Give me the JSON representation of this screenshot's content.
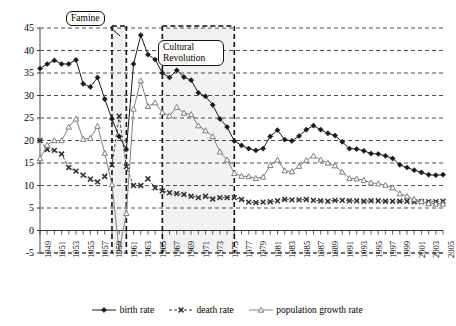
{
  "chart_data": {
    "type": "line",
    "title": "",
    "xlabel": "",
    "ylabel": "",
    "ylim": [
      -5,
      45
    ],
    "ytick_step": 5,
    "yticks": [
      "45",
      "40",
      "35",
      "30",
      "25",
      "20",
      "15",
      "10",
      "5",
      "0",
      "-5"
    ],
    "grid": true,
    "grid_style": "dashed-horizontal",
    "legend_position": "bottom-center",
    "x": [
      1949,
      1950,
      1951,
      1952,
      1953,
      1954,
      1955,
      1956,
      1957,
      1958,
      1959,
      1960,
      1961,
      1962,
      1963,
      1964,
      1965,
      1966,
      1967,
      1968,
      1969,
      1970,
      1971,
      1972,
      1973,
      1974,
      1975,
      1976,
      1977,
      1978,
      1979,
      1980,
      1981,
      1982,
      1983,
      1984,
      1985,
      1986,
      1987,
      1988,
      1989,
      1990,
      1991,
      1992,
      1993,
      1994,
      1995,
      1996,
      1997,
      1998,
      1999,
      2000,
      2001,
      2002,
      2003,
      2004,
      2005
    ],
    "xtick_labels": [
      "1949",
      "1951",
      "1953",
      "1955",
      "1957",
      "1959",
      "1961",
      "1963",
      "1965",
      "1967",
      "1969",
      "1971",
      "1973",
      "1975",
      "1977",
      "1979",
      "1981",
      "1983",
      "1985",
      "1987",
      "1989",
      "1991",
      "1993",
      "1995",
      "1997",
      "1999",
      "2001",
      "2003",
      "2005"
    ],
    "xtick_interval_years": 2,
    "series": [
      {
        "name": "birth rate",
        "marker": "filled-diamond",
        "color": "#1a1a1a",
        "line": "solid",
        "values": [
          36.0,
          37.0,
          37.8,
          37.0,
          37.0,
          37.9,
          32.6,
          31.9,
          34.0,
          29.2,
          24.8,
          20.9,
          18.0,
          37.0,
          43.4,
          39.1,
          38.0,
          35.0,
          34.0,
          35.6,
          34.1,
          33.4,
          30.6,
          29.8,
          27.9,
          24.8,
          23.0,
          19.9,
          18.9,
          18.2,
          17.8,
          18.2,
          20.9,
          22.3,
          20.2,
          19.9,
          21.0,
          22.4,
          23.3,
          22.4,
          21.6,
          21.1,
          19.7,
          18.2,
          18.1,
          17.7,
          17.1,
          17.0,
          16.6,
          16.0,
          14.6,
          14.0,
          13.4,
          12.9,
          12.4,
          12.3,
          12.4
        ]
      },
      {
        "name": "death rate",
        "marker": "x",
        "color": "#333333",
        "line": "dashed-thin",
        "values": [
          20.0,
          18.0,
          17.8,
          17.0,
          14.0,
          13.2,
          12.3,
          11.4,
          10.8,
          12.0,
          14.6,
          25.4,
          14.2,
          10.0,
          10.0,
          11.5,
          9.5,
          8.8,
          8.4,
          8.2,
          8.0,
          7.6,
          7.3,
          7.6,
          7.0,
          7.3,
          7.3,
          7.3,
          6.9,
          6.3,
          6.2,
          6.3,
          6.4,
          6.6,
          6.9,
          6.8,
          6.8,
          6.9,
          6.7,
          6.6,
          6.5,
          6.7,
          6.7,
          6.6,
          6.6,
          6.5,
          6.6,
          6.6,
          6.5,
          6.5,
          6.5,
          6.5,
          6.4,
          6.4,
          6.4,
          6.4,
          6.5
        ]
      },
      {
        "name": "population growth rate",
        "marker": "open-triangle",
        "color": "#808080",
        "line": "solid",
        "values": [
          16.0,
          19.0,
          20.0,
          20.0,
          23.0,
          24.8,
          20.3,
          20.5,
          23.2,
          17.2,
          10.2,
          -4.6,
          3.8,
          27.0,
          33.3,
          27.6,
          28.4,
          26.2,
          25.5,
          27.4,
          26.1,
          25.8,
          23.3,
          22.2,
          20.9,
          17.5,
          15.7,
          12.7,
          12.1,
          12.0,
          11.6,
          11.9,
          14.5,
          15.7,
          13.3,
          13.1,
          14.3,
          15.6,
          16.6,
          15.7,
          15.0,
          14.4,
          13.0,
          11.6,
          11.5,
          11.2,
          10.6,
          10.4,
          10.1,
          9.5,
          8.2,
          7.6,
          7.0,
          6.5,
          6.0,
          5.9,
          5.9
        ]
      }
    ],
    "annotations": [
      {
        "id": "famine",
        "label": "Famine",
        "span_start": 1959,
        "span_end": 1961,
        "shaded": true
      },
      {
        "id": "cultural-revolution",
        "label": "Cultural Revolution",
        "span_start": 1966,
        "span_end": 1976,
        "shaded": true
      }
    ]
  }
}
